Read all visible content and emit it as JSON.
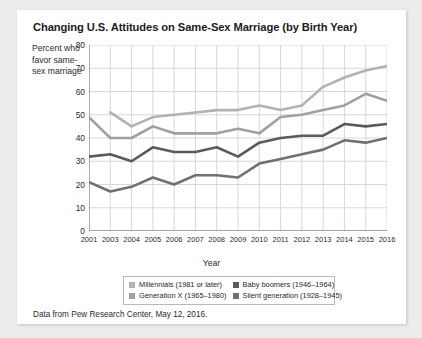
{
  "card": {
    "title": "Changing U.S. Attitudes on Same-Sex Marriage (by Birth Year)",
    "source_note": "Data from Pew Research Center, May 12, 2016."
  },
  "chart_data": {
    "type": "line",
    "title": "Changing U.S. Attitudes on Same-Sex Marriage (by Birth Year)",
    "xlabel": "Year",
    "ylabel": "Percent who favor same-sex marriage",
    "categories": [
      2001,
      2003,
      2004,
      2005,
      2006,
      2007,
      2008,
      2009,
      2010,
      2011,
      2012,
      2013,
      2014,
      2015,
      2016
    ],
    "xlim": [
      2001,
      2016
    ],
    "ylim": [
      0,
      80
    ],
    "yticks": [
      0,
      10,
      20,
      30,
      40,
      50,
      60,
      70,
      80
    ],
    "grid": true,
    "legend_position": "bottom",
    "series": [
      {
        "name": "Millennials (1981 or later)",
        "color": "#b2b2b2",
        "values": [
          null,
          51,
          45,
          49,
          50,
          51,
          52,
          52,
          54,
          52,
          54,
          62,
          66,
          69,
          71
        ]
      },
      {
        "name": "Generation X (1965–1980)",
        "color": "#a0a0a0",
        "values": [
          49,
          40,
          40,
          45,
          42,
          42,
          42,
          44,
          42,
          49,
          50,
          52,
          54,
          59,
          56
        ]
      },
      {
        "name": "Baby boomers (1946–1964)",
        "color": "#5a5a5a",
        "values": [
          32,
          33,
          30,
          36,
          34,
          34,
          36,
          32,
          38,
          40,
          41,
          41,
          46,
          45,
          46
        ]
      },
      {
        "name": "Silent generation (1928–1945)",
        "color": "#707070",
        "values": [
          21,
          17,
          19,
          23,
          20,
          24,
          24,
          23,
          29,
          31,
          33,
          35,
          39,
          38,
          40
        ]
      }
    ],
    "legend": [
      {
        "label": "Millennials (1981 or later)",
        "color": "#b2b2b2"
      },
      {
        "label": "Baby boomers (1946–1964)",
        "color": "#5a5a5a"
      },
      {
        "label": "Generation X (1965–1980)",
        "color": "#a0a0a0"
      },
      {
        "label": "Silent generation (1928–1945)",
        "color": "#707070"
      }
    ]
  }
}
